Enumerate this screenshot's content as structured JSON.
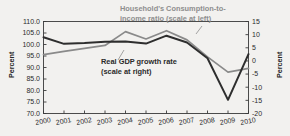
{
  "chart_data": {
    "type": "line",
    "title": "",
    "xlabel": "",
    "ylabel": "Percent",
    "ylabel_right": "Percent",
    "x": [
      2000,
      2001,
      2002,
      2003,
      2004,
      2005,
      2006,
      2007,
      2008,
      2009,
      2010
    ],
    "xtick_labels": [
      "2000",
      "2001",
      "2002",
      "2003",
      "2004",
      "2005",
      "2006",
      "2007",
      "2008",
      "2009",
      "2010"
    ],
    "ylim": [
      70.0,
      110.0
    ],
    "ytick_labels": [
      "110.0",
      "105.0",
      "100.0",
      "95.0",
      "90.0",
      "85.0",
      "80.0",
      "75.0",
      "70.0"
    ],
    "yticks": [
      110.0,
      105.0,
      100.0,
      95.0,
      90.0,
      85.0,
      80.0,
      75.0,
      70.0
    ],
    "ylim_right": [
      -20,
      15
    ],
    "ytick_labels_right": [
      "15",
      "10",
      "5",
      "0",
      "-5",
      "-10",
      "-15",
      "-20"
    ],
    "yticks_right": [
      15,
      10,
      5,
      0,
      -5,
      -10,
      -15,
      -20
    ],
    "grid": false,
    "legend_position": "inline-annotations",
    "series": [
      {
        "name": "Household's Consumption-to-income ratio (scale at left)",
        "axis": "left",
        "color": "#8a8a8a",
        "values": [
          95.6,
          97.0,
          98.3,
          99.6,
          105.6,
          102.4,
          106.0,
          102.0,
          94.6,
          88.0,
          89.6
        ]
      },
      {
        "name": "Real GDP growth rate (scale at right)",
        "axis": "right",
        "color": "#2e2e2e",
        "values": [
          9.0,
          6.5,
          6.8,
          7.3,
          7.4,
          6.6,
          9.6,
          7.0,
          1.0,
          -14.8,
          2.6
        ]
      }
    ],
    "annotations": [
      {
        "name": "consumption-ratio-label",
        "line1": "Household's Consumption-to-",
        "line2": "income ratio (scale at left)",
        "color": "#8e8e8e"
      },
      {
        "name": "gdp-growth-label",
        "line1": "Real GDP growth rate",
        "line2": "(scale at right)",
        "color": "#2a2a2a"
      }
    ]
  },
  "axes": {
    "left_title": "Percent",
    "right_title": "Percent"
  }
}
